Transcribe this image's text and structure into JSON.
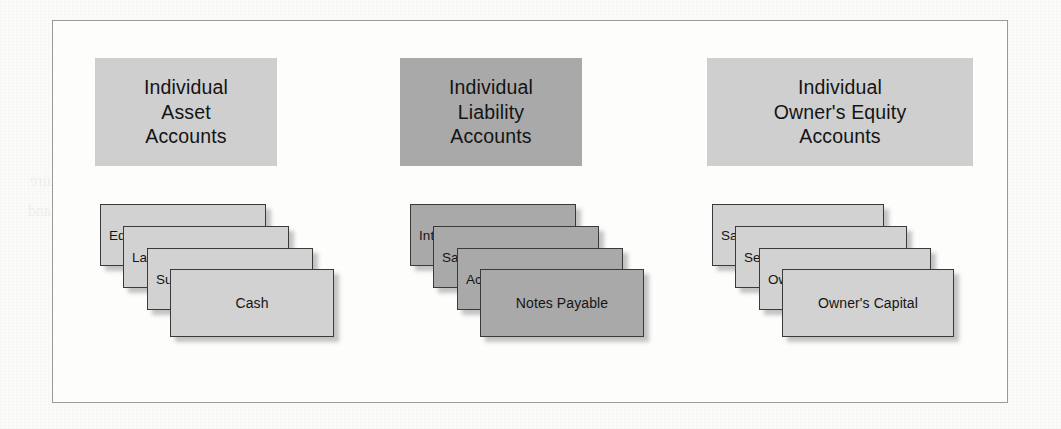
{
  "figure": {
    "background_color": "#fbfbf9",
    "frame_border_color": "#9a9a9a",
    "light_fill": "#d2d2d2",
    "dark_fill": "#a9a9a9",
    "card_border_color": "#3a3a3a"
  },
  "groups": [
    {
      "id": "asset",
      "tone": "light",
      "header": {
        "lines": [
          "Individual",
          "Asset",
          "Accounts"
        ],
        "box": {
          "left": 42,
          "top": 37,
          "width": 182,
          "height": 108
        }
      },
      "cards": [
        {
          "label": "Equipment",
          "left": 47,
          "top": 183,
          "width": 166,
          "height": 62,
          "align": "left"
        },
        {
          "label": "Land",
          "left": 70,
          "top": 205,
          "width": 166,
          "height": 62,
          "align": "left"
        },
        {
          "label": "Supplies",
          "left": 94,
          "top": 227,
          "width": 166,
          "height": 62,
          "align": "left"
        },
        {
          "label": "Cash",
          "left": 117,
          "top": 248,
          "width": 164,
          "height": 68,
          "align": "center"
        }
      ]
    },
    {
      "id": "liability",
      "tone": "dark",
      "header": {
        "lines": [
          "Individual",
          "Liability",
          "Accounts"
        ],
        "box": {
          "left": 347,
          "top": 37,
          "width": 182,
          "height": 108
        }
      },
      "cards": [
        {
          "label": "Interest Payable",
          "left": 357,
          "top": 183,
          "width": 166,
          "height": 62,
          "align": "left"
        },
        {
          "label": "Salaries and Wages Payable",
          "left": 380,
          "top": 205,
          "width": 166,
          "height": 62,
          "align": "left"
        },
        {
          "label": "Accounts Payable",
          "left": 404,
          "top": 227,
          "width": 166,
          "height": 62,
          "align": "left"
        },
        {
          "label": "Notes Payable",
          "left": 427,
          "top": 248,
          "width": 164,
          "height": 68,
          "align": "center"
        }
      ]
    },
    {
      "id": "owners-equity",
      "tone": "light",
      "header": {
        "lines": [
          "Individual",
          "Owner's Equity",
          "Accounts"
        ],
        "box": {
          "left": 654,
          "top": 37,
          "width": 266,
          "height": 108
        }
      },
      "cards": [
        {
          "label": "Salaries and Wages Expense",
          "left": 659,
          "top": 183,
          "width": 172,
          "height": 62,
          "align": "left"
        },
        {
          "label": "Service Revenue",
          "left": 682,
          "top": 205,
          "width": 172,
          "height": 62,
          "align": "left"
        },
        {
          "label": "Owner's Drawings",
          "left": 706,
          "top": 227,
          "width": 172,
          "height": 62,
          "align": "left"
        },
        {
          "label": "Owner's Capital",
          "left": 729,
          "top": 248,
          "width": 172,
          "height": 68,
          "align": "center"
        }
      ]
    }
  ],
  "ghost_text": [
    {
      "text": "Before studying this chapter, you should",
      "left": 60,
      "top": 30,
      "size": 17
    },
    {
      "text": "understanding accounting",
      "left": 380,
      "top": 28,
      "size": 16
    },
    {
      "text": "analyzing transactions",
      "left": 700,
      "top": 32,
      "size": 16
    },
    {
      "text": "and more solid, user require",
      "left": 30,
      "top": 172,
      "size": 16
    },
    {
      "text": "decide on what the item",
      "left": 330,
      "top": 170,
      "size": 16
    },
    {
      "text": "managing, 1000",
      "left": 720,
      "top": 168,
      "size": 16
    },
    {
      "text": "financial and",
      "left": 28,
      "top": 202,
      "size": 16
    },
    {
      "text": "closing the record",
      "left": 180,
      "top": 256,
      "size": 16
    },
    {
      "text": "during the next",
      "left": 430,
      "top": 262,
      "size": 16
    },
    {
      "text": "the general ledger",
      "left": 760,
      "top": 246,
      "size": 16
    }
  ]
}
